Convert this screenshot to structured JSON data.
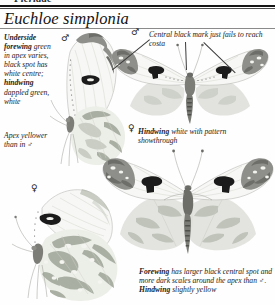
{
  "page": {
    "width": 275,
    "height": 305,
    "background": "#fefefe",
    "cropped_header_remnant": "Pieridae",
    "species_title": "Euchloe simplonia"
  },
  "symbols": {
    "male": "♂",
    "female": "♀"
  },
  "annotations": {
    "underside_forewing": {
      "lead": "Underside forewing",
      "text": " green in apex varies, black spot has white centre; ",
      "lead2": "hindwing",
      "text2": " dappled green, white"
    },
    "apex_yellower": {
      "text": "Apex yellower than in ♂"
    },
    "central_black_mark": {
      "text": "Central black mark just fails to reach costa"
    },
    "hindwing_showthrough": {
      "lead": "Hindwing",
      "text": " white with pattern showthrough"
    },
    "female_forewing": {
      "lead": "Forewing",
      "text": " has larger black central spot and more dark scales around the apex than ♂. ",
      "lead2": "Hindwing",
      "text2": " slightly yellow"
    }
  },
  "figures": [
    {
      "name": "male-underside",
      "sex": "♂",
      "view": "underside",
      "position": {
        "x": 55,
        "y": 30
      }
    },
    {
      "name": "male-upperside",
      "sex": "♂",
      "view": "upperside",
      "position": {
        "x": 108,
        "y": 38
      }
    },
    {
      "name": "female-underside",
      "sex": "♀",
      "view": "underside",
      "position": {
        "x": 18,
        "y": 188
      }
    },
    {
      "name": "female-upperside",
      "sex": "♀",
      "view": "upperside",
      "position": {
        "x": 104,
        "y": 142
      }
    }
  ],
  "colors": {
    "ink": "#1a1a1a",
    "rule": "#161616",
    "wing_white": "#f7f7f5",
    "apex_grey": "#8e8e8a",
    "spot_black": "#1b1b1b",
    "hindwing_green": "#c9cdc4"
  }
}
